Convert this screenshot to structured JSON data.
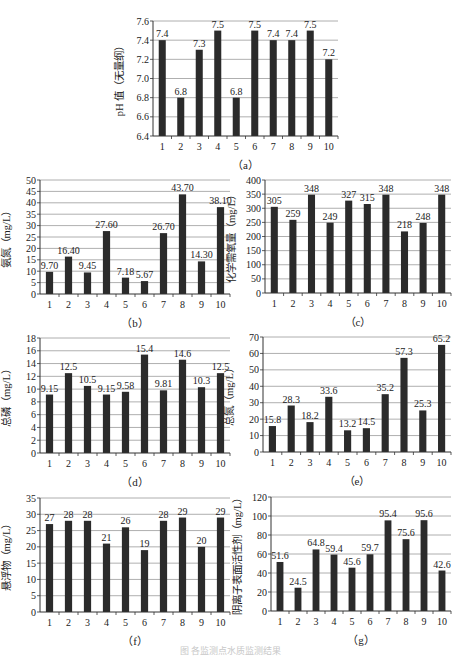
{
  "figure": {
    "footer_caption": "图  各监测点水质监测结果"
  },
  "chart_data": [
    {
      "id": "a",
      "type": "bar",
      "caption": "（a）",
      "title": "",
      "xlabel": "",
      "ylabel": "pH 值（无量纲）",
      "categories": [
        "1",
        "2",
        "3",
        "4",
        "5",
        "6",
        "7",
        "8",
        "9",
        "10"
      ],
      "values": [
        7.4,
        6.8,
        7.3,
        7.5,
        6.8,
        7.5,
        7.4,
        7.4,
        7.5,
        7.2
      ],
      "value_labels": [
        "7.4",
        "6.8",
        "7.3",
        "7.5",
        "6.8",
        "7.5",
        "7.4",
        "7.4",
        "7.5",
        "7.2"
      ],
      "ylim": [
        6.4,
        7.6
      ],
      "yticks": [
        6.4,
        6.6,
        6.8,
        7.0,
        7.2,
        7.4,
        7.6
      ],
      "ytick_labels": [
        "6.4",
        "6.6",
        "6.8",
        "7.0",
        "7.2",
        "7.4",
        "7.6"
      ],
      "grid": true,
      "bar_color": "#2b2b2b",
      "frame": {
        "x": 153,
        "y": 21,
        "w": 185,
        "h": 115
      }
    },
    {
      "id": "b",
      "type": "bar",
      "caption": "（b）",
      "title": "",
      "xlabel": "",
      "ylabel": "氨氮（mg/L）",
      "categories": [
        "1",
        "2",
        "3",
        "4",
        "5",
        "6",
        "7",
        "8",
        "9",
        "10"
      ],
      "values": [
        9.7,
        16.4,
        9.45,
        27.6,
        7.18,
        5.67,
        26.7,
        43.7,
        14.3,
        38.1
      ],
      "value_labels": [
        "9.70",
        "16.40",
        "9.45",
        "27.60",
        "7.18",
        "5.67",
        "26.70",
        "43.70",
        "14.30",
        "38.10"
      ],
      "ylim": [
        0,
        50
      ],
      "yticks": [
        0,
        5,
        10,
        15,
        20,
        25,
        30,
        35,
        40,
        45,
        50
      ],
      "ytick_labels": [
        "0",
        "5",
        "10",
        "15",
        "20",
        "25",
        "30",
        "35",
        "40",
        "45",
        "50"
      ],
      "grid": true,
      "bar_color": "#2b2b2b",
      "frame": {
        "x": 40,
        "y": 180,
        "w": 190,
        "h": 114
      }
    },
    {
      "id": "c",
      "type": "bar",
      "caption": "（c）",
      "title": "",
      "xlabel": "",
      "ylabel": "化学需氧量（mg/L）",
      "categories": [
        "1",
        "2",
        "3",
        "4",
        "5",
        "6",
        "7",
        "8",
        "9",
        "10"
      ],
      "values": [
        305,
        259,
        348,
        249,
        327,
        315,
        348,
        218,
        248,
        348
      ],
      "value_labels": [
        "305",
        "259",
        "348",
        "249",
        "327",
        "315",
        "348",
        "218",
        "248",
        "348"
      ],
      "ylim": [
        0,
        400
      ],
      "yticks": [
        0,
        50,
        100,
        150,
        200,
        250,
        300,
        350,
        400
      ],
      "ytick_labels": [
        "0",
        "50",
        "100",
        "150",
        "200",
        "250",
        "300",
        "350",
        "400"
      ],
      "grid": true,
      "bar_color": "#2b2b2b",
      "frame": {
        "x": 265,
        "y": 180,
        "w": 186,
        "h": 113
      }
    },
    {
      "id": "d",
      "type": "bar",
      "caption": "（d）",
      "title": "",
      "xlabel": "",
      "ylabel": "总磷（mg/L）",
      "categories": [
        "1",
        "2",
        "3",
        "4",
        "5",
        "6",
        "7",
        "8",
        "9",
        "10"
      ],
      "values": [
        9.15,
        12.5,
        10.5,
        9.15,
        9.58,
        15.4,
        9.81,
        14.6,
        10.3,
        12.5
      ],
      "value_labels": [
        "9.15",
        "12.5",
        "10.5",
        "9.15",
        "9.58",
        "15.4",
        "9.81",
        "14.6",
        "10.3",
        "12.5"
      ],
      "ylim": [
        0,
        18
      ],
      "yticks": [
        0,
        2,
        4,
        6,
        8,
        10,
        12,
        14,
        16,
        18
      ],
      "ytick_labels": [
        "0",
        "2",
        "4",
        "6",
        "8",
        "10",
        "12",
        "14",
        "16",
        "18"
      ],
      "grid": true,
      "bar_color": "#2b2b2b",
      "frame": {
        "x": 40,
        "y": 338,
        "w": 190,
        "h": 115
      }
    },
    {
      "id": "e",
      "type": "bar",
      "caption": "（e）",
      "title": "",
      "xlabel": "",
      "ylabel": "总氮（mg/L）",
      "categories": [
        "1",
        "2",
        "3",
        "4",
        "5",
        "6",
        "7",
        "8",
        "9",
        "10"
      ],
      "values": [
        15.8,
        28.3,
        18.2,
        33.6,
        13.2,
        14.5,
        35.2,
        57.3,
        25.3,
        65.2
      ],
      "value_labels": [
        "15.8",
        "28.3",
        "18.2",
        "33.6",
        "13.2",
        "14.5",
        "35.2",
        "57.3",
        "25.3",
        "65.2"
      ],
      "ylim": [
        0,
        70
      ],
      "yticks": [
        0,
        10,
        20,
        30,
        40,
        50,
        60,
        70
      ],
      "ytick_labels": [
        "0",
        "10",
        "20",
        "30",
        "40",
        "50",
        "60",
        "70"
      ],
      "grid": true,
      "bar_color": "#2b2b2b",
      "frame": {
        "x": 263,
        "y": 337,
        "w": 188,
        "h": 115
      }
    },
    {
      "id": "f",
      "type": "bar",
      "caption": "（f）",
      "title": "",
      "xlabel": "",
      "ylabel": "悬浮物（mg/L）",
      "categories": [
        "1",
        "2",
        "3",
        "4",
        "5",
        "6",
        "7",
        "8",
        "9",
        "10"
      ],
      "values": [
        27,
        28,
        28,
        21,
        26,
        19,
        28,
        29,
        20,
        29
      ],
      "value_labels": [
        "27",
        "28",
        "28",
        "21",
        "26",
        "19",
        "28",
        "29",
        "20",
        "29"
      ],
      "ylim": [
        0,
        35
      ],
      "yticks": [
        0,
        5,
        10,
        15,
        20,
        25,
        30,
        35
      ],
      "ytick_labels": [
        "0",
        "5",
        "10",
        "15",
        "20",
        "25",
        "30",
        "35"
      ],
      "grid": true,
      "bar_color": "#2b2b2b",
      "frame": {
        "x": 40,
        "y": 498,
        "w": 190,
        "h": 114
      }
    },
    {
      "id": "g",
      "type": "bar",
      "caption": "（g）",
      "title": "",
      "xlabel": "",
      "ylabel": "阴离子表面活性剂（mg/L）",
      "categories": [
        "1",
        "2",
        "3",
        "4",
        "5",
        "6",
        "7",
        "8",
        "9",
        "10"
      ],
      "values": [
        51.6,
        24.5,
        64.8,
        59.4,
        45.6,
        59.7,
        95.4,
        75.6,
        95.6,
        42.6
      ],
      "value_labels": [
        "51.6",
        "24.5",
        "64.8",
        "59.4",
        "45.6",
        "59.7",
        "95.4",
        "75.6",
        "95.6",
        "42.6"
      ],
      "ylim": [
        0,
        120
      ],
      "yticks": [
        0,
        20,
        40,
        60,
        80,
        100,
        120
      ],
      "ytick_labels": [
        "0",
        "20",
        "40",
        "60",
        "80",
        "100",
        "120"
      ],
      "grid": true,
      "bar_color": "#2b2b2b",
      "frame": {
        "x": 271,
        "y": 497,
        "w": 180,
        "h": 114
      }
    }
  ]
}
